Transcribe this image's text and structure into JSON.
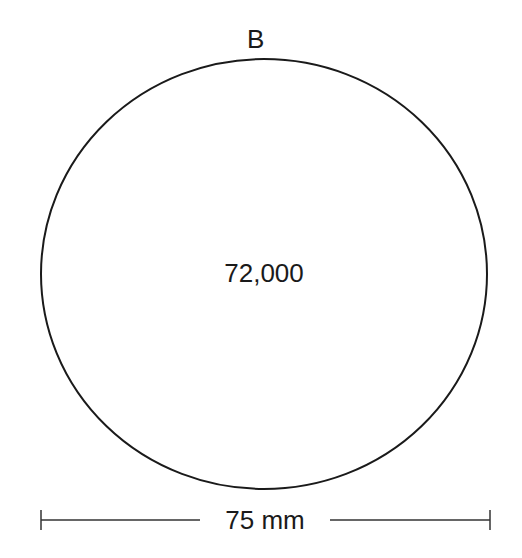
{
  "diagram": {
    "shape": "circle",
    "top_label": "B",
    "center_value": "72,000",
    "dimension_label": "75 mm",
    "stroke_color": "#1a1a1a"
  }
}
